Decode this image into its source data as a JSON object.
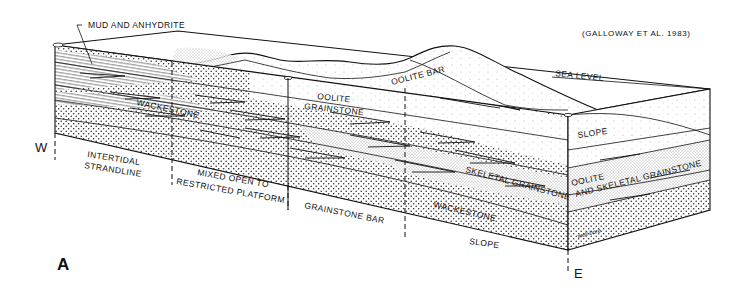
{
  "citation": "(GALLOWAY ET AL. 1983)",
  "panel_label": "A",
  "directions": {
    "west": "W",
    "east": "E"
  },
  "surface_labels": {
    "mud_anhydrite": "MUD AND ANHYDRITE",
    "sea_level": "SEA LEVEL",
    "oolite_bar": "OOLITE BAR",
    "slope_top": "SLOPE"
  },
  "section_labels": {
    "wackestone_upper": "WACKESTONE",
    "oolite_grainstone_1": "OOLITE",
    "oolite_grainstone_2": "GRAINSTONE",
    "skeletal_grainstone": "SKELETAL GRAINSTONE",
    "wackestone_lower": "WACKESTONE",
    "oolite_skeletal_1": "OOLITE",
    "oolite_skeletal_2": "AND SKELETAL GRAINSTONE",
    "well_bore": "well bore"
  },
  "facies_zones": [
    {
      "line1": "INTERTIDAL",
      "line2": "STRANDLINE"
    },
    {
      "line1": "MIXED OPEN TO",
      "line2": "RESTRICTED PLATFORM"
    },
    {
      "line1": "GRAINSTONE BAR",
      "line2": ""
    },
    {
      "line1": "SLOPE",
      "line2": ""
    }
  ],
  "colors": {
    "ink": "#111111",
    "paper": "#ffffff"
  }
}
